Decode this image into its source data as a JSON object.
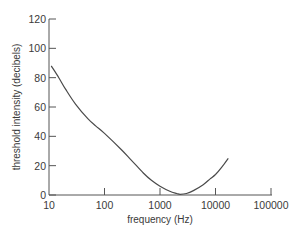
{
  "chart_data": {
    "type": "line",
    "title": "",
    "xlabel": "frequency (Hz)",
    "ylabel": "threshold intensity (decibels)",
    "xscale": "log",
    "xlim": [
      10,
      100000
    ],
    "ylim": [
      0,
      120
    ],
    "x_ticks": [
      "10",
      "100",
      "1000",
      "10000",
      "100000"
    ],
    "y_ticks": [
      "0",
      "20",
      "40",
      "60",
      "80",
      "100",
      "120"
    ],
    "grid": false,
    "legend": null,
    "series": [
      {
        "name": "hearing threshold",
        "x": [
          11,
          15,
          20,
          30,
          50,
          70,
          100,
          200,
          300,
          500,
          700,
          1000,
          1500,
          2000,
          2300,
          3000,
          4000,
          6000,
          8000,
          10000,
          13000,
          17000
        ],
        "y": [
          88,
          80,
          72,
          62,
          52,
          47,
          42,
          31,
          24,
          15,
          10,
          6,
          2.5,
          1,
          0.5,
          1,
          3,
          7,
          11,
          14,
          19,
          25
        ]
      }
    ]
  }
}
